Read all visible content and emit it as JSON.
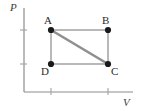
{
  "figure": {
    "kind": "pv-diagram",
    "axes": {
      "y_label": "P",
      "x_label": "V",
      "axis_color": "#8c8c8c",
      "origin": {
        "x": 24,
        "y": 92
      },
      "y_top": 8,
      "x_right": 133,
      "y_ticks": [
        {
          "y": 30,
          "length": 7
        },
        {
          "y": 64,
          "length": 7
        }
      ],
      "x_ticks": [
        {
          "x": 51,
          "length": 7
        },
        {
          "x": 108,
          "length": 7
        }
      ]
    },
    "cycle": {
      "rectangle_color": "#b9b9b9",
      "diagonal_color": "#8f8f8f",
      "point_color": "#1a1a1a",
      "point_radius": 3.1,
      "points": [
        {
          "id": "A",
          "label": "A",
          "x": 51,
          "y": 30,
          "label_x": 44,
          "label_y": 15
        },
        {
          "id": "B",
          "label": "B",
          "x": 108,
          "y": 30,
          "label_x": 102,
          "label_y": 15
        },
        {
          "id": "C",
          "label": "C",
          "x": 108,
          "y": 64,
          "label_x": 111,
          "label_y": 66
        },
        {
          "id": "D",
          "label": "D",
          "x": 51,
          "y": 64,
          "label_x": 41,
          "label_y": 66
        }
      ],
      "edges": [
        {
          "from": "A",
          "to": "B"
        },
        {
          "from": "B",
          "to": "C"
        },
        {
          "from": "C",
          "to": "D"
        },
        {
          "from": "D",
          "to": "A"
        }
      ],
      "diagonal": {
        "from": "A",
        "to": "C"
      }
    }
  }
}
